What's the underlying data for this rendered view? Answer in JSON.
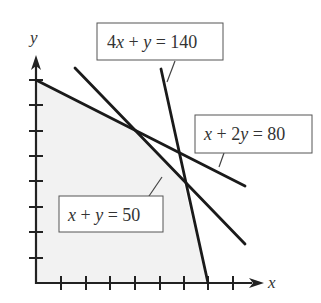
{
  "diagram": {
    "type": "linear-programming-feasible-region",
    "axes": {
      "x_label": "x",
      "y_label": "y",
      "x_ticks": 8,
      "y_ticks": 8,
      "units_per_tick": 5
    },
    "constraints": [
      {
        "id": "c1",
        "label": "4x + y = 140",
        "label_parts": [
          "4",
          "x",
          " + ",
          "y",
          " = 140"
        ],
        "x_intercept": 35,
        "y_intercept": 140
      },
      {
        "id": "c2",
        "label": "x + 2y = 80",
        "label_parts": [
          "x",
          " + 2",
          "y",
          " = 80"
        ],
        "x_intercept": 80,
        "y_intercept": 40
      },
      {
        "id": "c3",
        "label": "x + y = 50",
        "label_parts": [
          "x",
          " + ",
          "y",
          " = 50"
        ],
        "x_intercept": 50,
        "y_intercept": 50
      }
    ],
    "feasible_region": {
      "vertices": [
        [
          0,
          0
        ],
        [
          0,
          40
        ],
        [
          20,
          30
        ],
        [
          30,
          20
        ],
        [
          35,
          0
        ]
      ],
      "fill": "#f2f2f2"
    },
    "colors": {
      "line": "#1a1a1a",
      "axis": "#222222",
      "label_box_border": "#555555",
      "text": "#333333"
    }
  }
}
